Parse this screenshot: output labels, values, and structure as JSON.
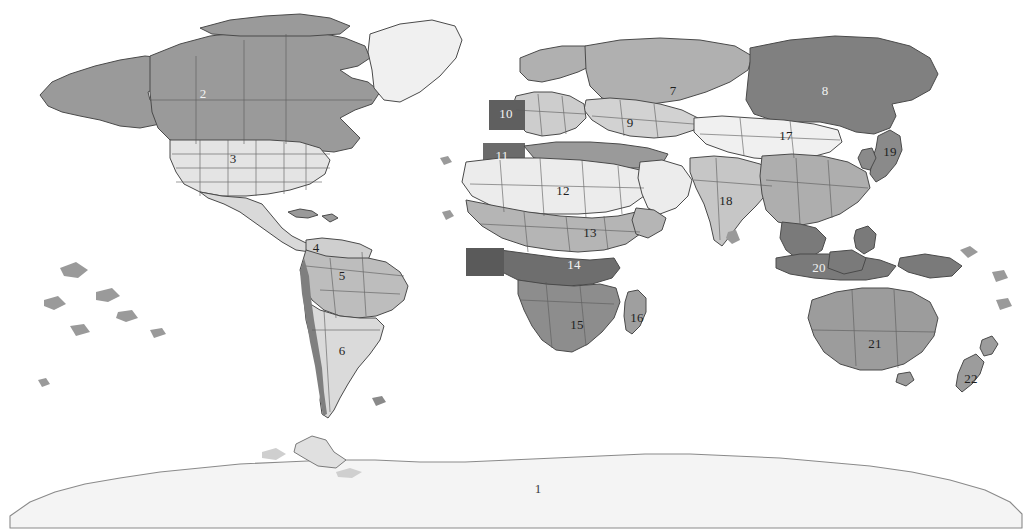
{
  "map": {
    "title": "World map with 22 numbered regions",
    "projection": "equirectangular",
    "background_color": "#ffffff",
    "border_color": "#4a4a4a",
    "palette": {
      "very_light": "#ececec",
      "light": "#dcdcdc",
      "light_mid": "#cccccc",
      "mid": "#b3b3b3",
      "mid_dark": "#9a9a9a",
      "dark": "#7f7f7f",
      "darker": "#6e6e6e",
      "darkest": "#555555",
      "outline": "#4a4a4a",
      "antarctica": "#f4f4f4"
    },
    "regions": [
      {
        "id": 1,
        "number": "1",
        "name": "antarctica",
        "x": 538,
        "y": 488,
        "text_tone": "mid",
        "fill": "#f4f4f4"
      },
      {
        "id": 2,
        "number": "2",
        "name": "canada-alaska",
        "x": 203,
        "y": 93,
        "text_tone": "light",
        "fill": "#9a9a9a"
      },
      {
        "id": 3,
        "number": "3",
        "name": "united-states",
        "x": 233,
        "y": 158,
        "text_tone": "dark",
        "fill": "#e4e4e4"
      },
      {
        "id": 4,
        "number": "4",
        "name": "northern-south-america",
        "x": 316,
        "y": 247,
        "text_tone": "dark",
        "fill": "#cfcfcf"
      },
      {
        "id": 5,
        "number": "5",
        "name": "brazil-amazon",
        "x": 342,
        "y": 275,
        "text_tone": "dark",
        "fill": "#bdbdbd"
      },
      {
        "id": 6,
        "number": "6",
        "name": "southern-cone",
        "x": 342,
        "y": 350,
        "text_tone": "dark",
        "fill": "#dadada"
      },
      {
        "id": 7,
        "number": "7",
        "name": "northern-europe-russia",
        "x": 673,
        "y": 90,
        "text_tone": "dark",
        "fill": "#b0b0b0"
      },
      {
        "id": 8,
        "number": "8",
        "name": "siberia",
        "x": 825,
        "y": 90,
        "text_tone": "light",
        "fill": "#808080"
      },
      {
        "id": 9,
        "number": "9",
        "name": "eastern-europe",
        "x": 630,
        "y": 122,
        "text_tone": "dark",
        "fill": "#d2d2d2"
      },
      {
        "id": 10,
        "number": "10",
        "name": "british-isles",
        "x": 506,
        "y": 113,
        "text_tone": "light",
        "fill": "#5f5f5f"
      },
      {
        "id": 11,
        "number": "11",
        "name": "iberia-maghreb",
        "x": 502,
        "y": 155,
        "text_tone": "light",
        "fill": "#6b6b6b"
      },
      {
        "id": 12,
        "number": "12",
        "name": "sahara-north-africa",
        "x": 563,
        "y": 190,
        "text_tone": "dark",
        "fill": "#ececec"
      },
      {
        "id": 13,
        "number": "13",
        "name": "sahel-central-africa",
        "x": 590,
        "y": 232,
        "text_tone": "dark",
        "fill": "#b5b5b5"
      },
      {
        "id": 14,
        "number": "14",
        "name": "equatorial-africa",
        "x": 574,
        "y": 264,
        "text_tone": "light",
        "fill": "#6e6e6e"
      },
      {
        "id": 15,
        "number": "15",
        "name": "southern-africa",
        "x": 577,
        "y": 324,
        "text_tone": "dark",
        "fill": "#8d8d8d"
      },
      {
        "id": 16,
        "number": "16",
        "name": "madagascar",
        "x": 637,
        "y": 317,
        "text_tone": "dark",
        "fill": "#9f9f9f"
      },
      {
        "id": 17,
        "number": "17",
        "name": "central-asia-mongolia",
        "x": 786,
        "y": 135,
        "text_tone": "dark",
        "fill": "#f0f0f0"
      },
      {
        "id": 18,
        "number": "18",
        "name": "south-asia-india",
        "x": 726,
        "y": 200,
        "text_tone": "dark",
        "fill": "#c6c6c6"
      },
      {
        "id": 19,
        "number": "19",
        "name": "japan-korea",
        "x": 890,
        "y": 151,
        "text_tone": "dark",
        "fill": "#8a8a8a"
      },
      {
        "id": 20,
        "number": "20",
        "name": "southeast-asia",
        "x": 819,
        "y": 267,
        "text_tone": "light",
        "fill": "#7a7a7a"
      },
      {
        "id": 21,
        "number": "21",
        "name": "australia",
        "x": 875,
        "y": 343,
        "text_tone": "dark",
        "fill": "#9c9c9c"
      },
      {
        "id": 22,
        "number": "22",
        "name": "new-zealand",
        "x": 971,
        "y": 378,
        "text_tone": "dark",
        "fill": "#9c9c9c"
      }
    ]
  }
}
